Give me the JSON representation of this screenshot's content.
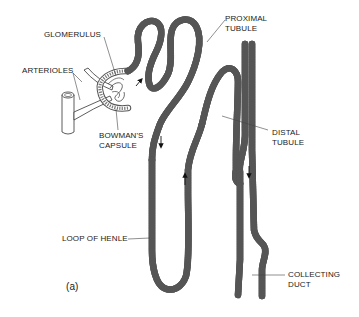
{
  "figure": {
    "panel_label": "(a)",
    "labels": {
      "glomerulus": "GLOMERULUS",
      "arterioles": "ARTERIOLES",
      "bowmans_capsule_line1": "BOWMAN'S",
      "bowmans_capsule_line2": "CAPSULE",
      "proximal_tubule_line1": "PROXIMAL",
      "proximal_tubule_line2": "TUBULE",
      "distal_tubule_line1": "DISTAL",
      "distal_tubule_line2": "TUBULE",
      "loop_of_henle": "LOOP OF HENLE",
      "collecting_duct_line1": "COLLECTING",
      "collecting_duct_line2": "DUCT"
    },
    "colors": {
      "line": "#555555",
      "text": "#222222",
      "background": "#ffffff"
    }
  }
}
